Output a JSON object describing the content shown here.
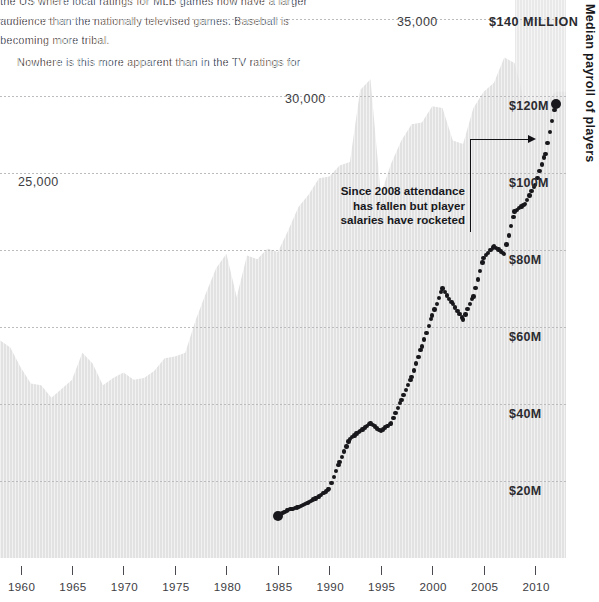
{
  "article": {
    "lines": [
      "the US where local ratings for MLB games now have a larger",
      "audience than the nationally televised games. Baseball is",
      "becoming more tribal.",
      "Nowhere is this more apparent than in the TV ratings for"
    ]
  },
  "axis_title_right": "Median payroll of players",
  "annotation": {
    "line1": "Since 2008 attendance",
    "line2": "has fallen but player",
    "line3": "salaries have rocketed"
  },
  "colors": {
    "area_fill": "#e2e2e3",
    "band_shade": "#c9c9cb",
    "dot": "#18181c",
    "grid": "#b9b9bd",
    "body_text": "#5d5d63"
  },
  "chart_data": {
    "type": "area",
    "title": "",
    "xlabel": "",
    "ylabel": "Average attendance per game",
    "ylabel_right": "Median payroll of players",
    "grid": true,
    "legend": "none",
    "xlim": [
      1958,
      2013
    ],
    "xticks": [
      1960,
      1965,
      1970,
      1975,
      1980,
      1985,
      1990,
      1995,
      2000,
      2005,
      2010
    ],
    "xticklabels": [
      "1960",
      "1965",
      "1970",
      "1975",
      "1980",
      "1985",
      "1990",
      "1995",
      "2000",
      "2005",
      "2010"
    ],
    "left_axis": {
      "name": "Average attendance",
      "ylim": [
        5000,
        36000
      ],
      "ticks": [
        25000,
        30000,
        35000
      ],
      "ticklabels": [
        "25,000",
        "30,000",
        "35,000"
      ]
    },
    "right_axis": {
      "name": "Median payroll of players",
      "ylim": [
        0,
        145000000
      ],
      "ticks": [
        20000000,
        40000000,
        60000000,
        80000000,
        100000000,
        120000000,
        140000000
      ],
      "ticklabels": [
        "$20M",
        "$40M",
        "$60M",
        "$80M",
        "$100M",
        "$120M",
        "$140 MILLION"
      ]
    },
    "highlight_band": {
      "from": 2008,
      "to": 2013,
      "label": "since 2008"
    },
    "series": [
      {
        "name": "Average attendance per game",
        "type": "area",
        "axis": "left",
        "x": [
          1958,
          1959,
          1960,
          1961,
          1962,
          1963,
          1964,
          1965,
          1966,
          1967,
          1968,
          1969,
          1970,
          1971,
          1972,
          1973,
          1974,
          1975,
          1976,
          1977,
          1978,
          1979,
          1980,
          1981,
          1982,
          1983,
          1984,
          1985,
          1986,
          1987,
          1988,
          1989,
          1990,
          1991,
          1992,
          1993,
          1994,
          1995,
          1996,
          1997,
          1998,
          1999,
          2000,
          2001,
          2002,
          2003,
          2004,
          2005,
          2006,
          2007,
          2008,
          2009,
          2010,
          2011,
          2012
        ],
        "values": [
          17100,
          16700,
          15600,
          14700,
          14600,
          13900,
          14400,
          14900,
          16400,
          15800,
          14600,
          15000,
          15300,
          14900,
          15000,
          15400,
          16100,
          16200,
          16400,
          18200,
          19700,
          21100,
          21900,
          19500,
          21800,
          21600,
          22200,
          22000,
          23200,
          24500,
          25200,
          26100,
          26200,
          26800,
          27000,
          31000,
          31600,
          25200,
          26900,
          28200,
          29100,
          29200,
          30100,
          30000,
          28200,
          28000,
          30000,
          30900,
          31400,
          32800,
          32500,
          30300,
          30100,
          30300,
          30900
        ]
      },
      {
        "name": "Median payroll of players",
        "type": "scatter",
        "axis": "right",
        "x": [
          1985,
          1986,
          1987,
          1988,
          1989,
          1990,
          1991,
          1992,
          1993,
          1994,
          1995,
          1996,
          1997,
          1998,
          1999,
          2000,
          2001,
          2002,
          2003,
          2004,
          2005,
          2006,
          2007,
          2008,
          2009,
          2010,
          2011,
          2012
        ],
        "values": [
          11000000,
          12500000,
          13200000,
          14500000,
          16000000,
          18000000,
          25000000,
          31000000,
          33000000,
          35000000,
          33000000,
          35000000,
          41000000,
          47000000,
          55000000,
          63000000,
          70000000,
          66000000,
          62000000,
          68000000,
          78000000,
          81000000,
          79000000,
          90000000,
          92000000,
          97000000,
          105000000,
          118000000
        ]
      }
    ],
    "annotations": [
      {
        "text": "Since 2008 attendance has fallen but player salaries have rocketed",
        "arrow_from_year": 2006,
        "arrow_to_year": 2011
      }
    ]
  }
}
